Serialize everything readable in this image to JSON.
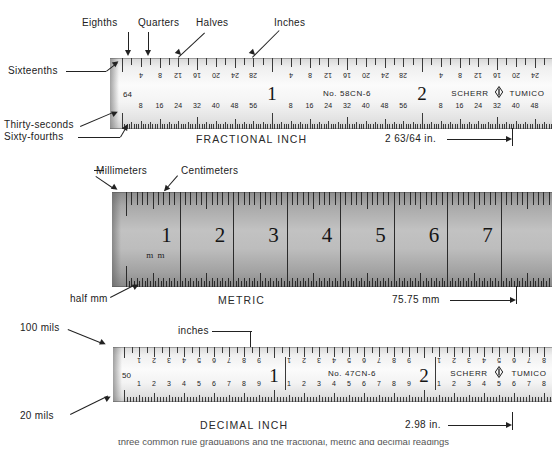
{
  "figure": {
    "title_top_cropped": "Scherr-Tumico rules",
    "bottom_cropped_caption": "three common rule graduations and the fractional, metric and decimal readings"
  },
  "rulers": [
    {
      "id": "fractional",
      "caption": "FRACTIONAL INCH",
      "brand": "SCHERR",
      "brand2": "TUMICO",
      "model": "No. 58CN-6",
      "measurement": "2 63/64 in.",
      "top_scale_denominator": "16",
      "bottom_scale_denominator": "64",
      "bottom_scale_marker": "64",
      "inch_numbers": [
        "1",
        "2",
        "3"
      ],
      "top_tick_numbers": [
        "4",
        "8",
        "12",
        "16",
        "20",
        "24",
        "28"
      ],
      "bottom_tick_numbers": [
        "8",
        "16",
        "24",
        "32",
        "40",
        "48",
        "56"
      ],
      "callouts": [
        {
          "name": "eighths",
          "text": "Eighths"
        },
        {
          "name": "quarters",
          "text": "Quarters"
        },
        {
          "name": "halves",
          "text": "Halves"
        },
        {
          "name": "inches",
          "text": "Inches"
        },
        {
          "name": "sixteenths",
          "text": "Sixteenths"
        },
        {
          "name": "thirty-seconds",
          "text": "Thirty-seconds"
        },
        {
          "name": "sixty-fourths",
          "text": "Sixty-fourths"
        }
      ]
    },
    {
      "id": "metric",
      "caption": "METRIC",
      "measurement": "75.75 mm",
      "unit_mark": "m m",
      "cm_numbers": [
        "1",
        "2",
        "3",
        "4",
        "5",
        "6",
        "7",
        "8"
      ],
      "callouts": [
        {
          "name": "millimeters",
          "text": "Millimeters"
        },
        {
          "name": "centimeters",
          "text": "Centimeters"
        },
        {
          "name": "half-mm",
          "text": "half mm"
        }
      ]
    },
    {
      "id": "decimal",
      "caption": "DECIMAL INCH",
      "brand": "SCHERR",
      "brand2": "TUMICO",
      "model": "No. 47CN-6",
      "measurement": "2.98 in.",
      "bottom_scale_marker": "50",
      "inch_numbers": [
        "1",
        "2",
        "3"
      ],
      "top_tick_numbers": [
        "1",
        "2",
        "3",
        "4",
        "5",
        "6",
        "7",
        "8",
        "9"
      ],
      "bottom_tick_numbers": [
        "1",
        "2",
        "3",
        "4",
        "5",
        "6",
        "7",
        "8",
        "9"
      ],
      "callouts": [
        {
          "name": "hundred-mils",
          "text": "100 mils"
        },
        {
          "name": "inches",
          "text": "inches"
        },
        {
          "name": "twenty-mils",
          "text": "20 mils"
        }
      ]
    }
  ],
  "colors": {
    "ink": "#222222",
    "rule_light": "#f4f4f4",
    "rule_dark": "#b0b0b0"
  }
}
